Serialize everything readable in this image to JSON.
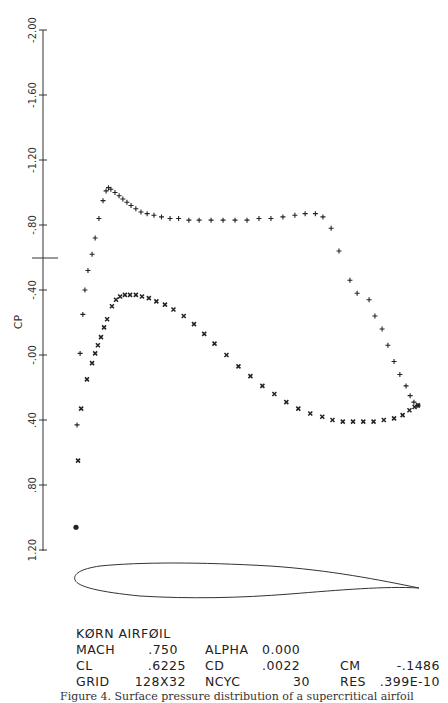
{
  "chart_data": {
    "type": "scatter",
    "xlabel": "",
    "ylabel": "CP",
    "ylim": [
      -2.0,
      1.2
    ],
    "y_inverted": true,
    "y_ticks": [
      "-2.00",
      "-1.60",
      "-1.20",
      "-.80",
      "-.40",
      "-.00",
      ".40",
      ".80",
      "1.20"
    ],
    "y_tick_values": [
      -2.0,
      -1.6,
      -1.2,
      -0.8,
      -0.4,
      0.0,
      0.4,
      0.8,
      1.2
    ],
    "grid": false,
    "legend": null,
    "series": [
      {
        "name": "upper surface",
        "marker": "+",
        "x": [
          0.003,
          0.012,
          0.02,
          0.026,
          0.035,
          0.047,
          0.056,
          0.067,
          0.079,
          0.088,
          0.095,
          0.102,
          0.114,
          0.126,
          0.137,
          0.149,
          0.161,
          0.175,
          0.19,
          0.208,
          0.228,
          0.25,
          0.275,
          0.3,
          0.33,
          0.36,
          0.395,
          0.43,
          0.465,
          0.5,
          0.535,
          0.57,
          0.605,
          0.64,
          0.67,
          0.7,
          0.722,
          0.746,
          0.769,
          0.801,
          0.822,
          0.857,
          0.874,
          0.895,
          0.912,
          0.93,
          0.947,
          0.965,
          0.977,
          0.988,
          1.0
        ],
        "cp": [
          0.43,
          -0.01,
          -0.25,
          -0.4,
          -0.52,
          -0.62,
          -0.72,
          -0.84,
          -0.95,
          -1.01,
          -1.03,
          -1.02,
          -1.0,
          -0.98,
          -0.96,
          -0.94,
          -0.92,
          -0.9,
          -0.88,
          -0.87,
          -0.86,
          -0.85,
          -0.84,
          -0.84,
          -0.83,
          -0.83,
          -0.83,
          -0.83,
          -0.83,
          -0.83,
          -0.84,
          -0.84,
          -0.85,
          -0.86,
          -0.87,
          -0.87,
          -0.85,
          -0.78,
          -0.64,
          -0.46,
          -0.38,
          -0.34,
          -0.24,
          -0.16,
          -0.06,
          0.04,
          0.12,
          0.19,
          0.25,
          0.29,
          0.31
        ]
      },
      {
        "name": "lower surface",
        "marker": "x",
        "x": [
          0.006,
          0.015,
          0.032,
          0.047,
          0.056,
          0.064,
          0.073,
          0.082,
          0.091,
          0.105,
          0.117,
          0.129,
          0.143,
          0.158,
          0.175,
          0.193,
          0.213,
          0.235,
          0.26,
          0.285,
          0.315,
          0.345,
          0.375,
          0.405,
          0.44,
          0.475,
          0.51,
          0.545,
          0.58,
          0.615,
          0.65,
          0.685,
          0.72,
          0.75,
          0.78,
          0.81,
          0.84,
          0.87,
          0.9,
          0.93,
          0.955,
          0.975,
          0.99,
          1.0
        ],
        "cp": [
          0.65,
          0.33,
          0.15,
          0.05,
          -0.01,
          -0.06,
          -0.11,
          -0.17,
          -0.22,
          -0.3,
          -0.34,
          -0.36,
          -0.37,
          -0.37,
          -0.37,
          -0.36,
          -0.35,
          -0.33,
          -0.31,
          -0.28,
          -0.24,
          -0.19,
          -0.13,
          -0.07,
          0.0,
          0.07,
          0.13,
          0.19,
          0.24,
          0.29,
          0.33,
          0.36,
          0.38,
          0.4,
          0.41,
          0.41,
          0.41,
          0.41,
          0.4,
          0.39,
          0.37,
          0.34,
          0.32,
          0.31
        ]
      },
      {
        "name": "stagnation",
        "marker": "blob",
        "x": [
          0.0
        ],
        "cp": [
          1.06
        ]
      }
    ],
    "airfoil_outline": true
  },
  "info": {
    "title": "KØRN AIRFØIL",
    "rows": [
      {
        "label1": "MACH",
        "value1": ".750",
        "label2": "ALPHA",
        "value2": "0.000",
        "label3": "",
        "value3": ""
      },
      {
        "label1": "CL",
        "value1": ".6225",
        "label2": "CD",
        "value2": ".0022",
        "label3": "CM",
        "value3": "-.1486"
      },
      {
        "label1": "GRID",
        "value1": "128X32",
        "label2": "NCYC",
        "value2": "30",
        "label3": "RES",
        "value3": ".399E-10"
      }
    ]
  },
  "caption": "Figure 4.  Surface pressure distribution of a supercritical airfoil"
}
